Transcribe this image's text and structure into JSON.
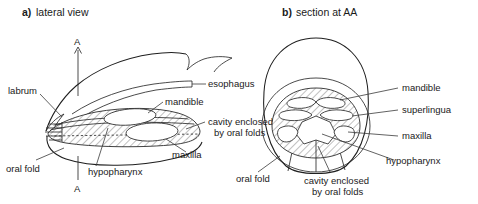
{
  "figure": {
    "background": "#ffffff",
    "ink_color": "#1f1f1f"
  },
  "panels": [
    {
      "id": "a",
      "letter": "a)",
      "caption": "lateral view",
      "section_marks": [
        "A",
        "A"
      ],
      "labels": [
        {
          "name": "labrum",
          "text": "labrum"
        },
        {
          "name": "esophagus",
          "text": "esophagus"
        },
        {
          "name": "mandible",
          "text": "mandible"
        },
        {
          "name": "cavity-line1",
          "text": "cavity enclosed"
        },
        {
          "name": "cavity-line2",
          "text": "by oral folds"
        },
        {
          "name": "maxilla",
          "text": "maxilla"
        },
        {
          "name": "oral-fold",
          "text": "oral fold"
        },
        {
          "name": "hypopharynx",
          "text": "hypopharynx"
        }
      ]
    },
    {
      "id": "b",
      "letter": "b)",
      "caption": "section at AA",
      "labels": [
        {
          "name": "mandible",
          "text": "mandible"
        },
        {
          "name": "superlingua",
          "text": "superlingua"
        },
        {
          "name": "maxilla",
          "text": "maxilla"
        },
        {
          "name": "hypopharynx",
          "text": "hypopharynx"
        },
        {
          "name": "oral-fold",
          "text": "oral fold"
        },
        {
          "name": "cavity-line1",
          "text": "cavity enclosed"
        },
        {
          "name": "cavity-line2",
          "text": "by oral folds"
        }
      ]
    }
  ]
}
